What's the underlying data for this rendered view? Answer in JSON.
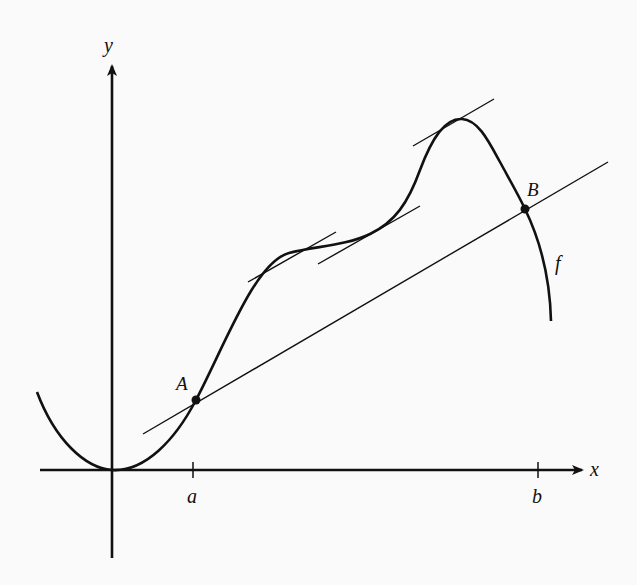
{
  "figure": {
    "axes": {
      "x_label": "x",
      "y_label": "y",
      "ticks": [
        {
          "label": "a",
          "x": 193
        },
        {
          "label": "b",
          "x": 538
        }
      ]
    },
    "points": [
      {
        "label": "A",
        "x": 196,
        "y": 400
      },
      {
        "label": "B",
        "x": 525,
        "y": 209
      }
    ],
    "curve_label": "f",
    "tangent_lines_count": 3,
    "secant_line": {
      "from": "A",
      "to": "B"
    },
    "colors": {
      "ink": "#111111",
      "background": "#fafafa"
    }
  }
}
